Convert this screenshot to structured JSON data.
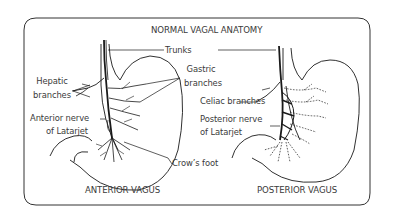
{
  "title": "NORMAL VAGAL ANATOMY",
  "panels": {
    "anterior": {
      "caption": "ANTERIOR VAGUS",
      "labels": {
        "hepatic_line1": "Hepatic",
        "hepatic_line2": "branches",
        "anterior_nerve_line1": "Anterior nerve",
        "anterior_nerve_line2": "of Latarjet"
      }
    },
    "posterior": {
      "caption": "POSTERIOR VAGUS",
      "labels": {
        "celiac": "Celiac branches",
        "posterior_nerve_line1": "Posterior nerve",
        "posterior_nerve_line2": "of Latarjet"
      }
    }
  },
  "shared_labels": {
    "trunks": "Trunks",
    "gastric_line1": "Gastric",
    "gastric_line2": "branches",
    "crows_foot": "Crow’s foot"
  },
  "colors": {
    "stroke": "#1a1a1a",
    "frame": "#333333",
    "text": "#3a3a3a"
  }
}
